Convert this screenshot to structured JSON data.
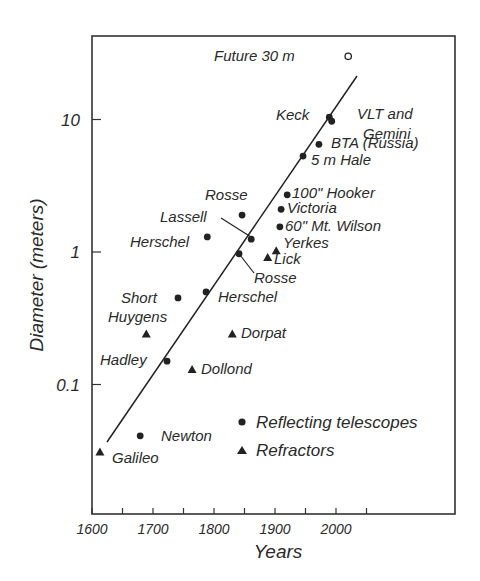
{
  "chart_data": {
    "type": "scatter",
    "title": "",
    "xlabel": "Years",
    "ylabel": "Diameter (meters)",
    "yscale": "log",
    "xlim": [
      1600,
      2190
    ],
    "ylim": [
      0.012,
      70
    ],
    "x_ticks": [
      1600,
      1650,
      1700,
      1750,
      1800,
      1850,
      1900,
      1950,
      2000,
      2050
    ],
    "x_tick_labels": [
      "1600",
      "1700",
      "1800",
      "1900",
      "2000"
    ],
    "y_tick_labels": [
      "10",
      "1",
      "0.1"
    ],
    "grid": false,
    "legend": {
      "position": "lower right",
      "entries": [
        {
          "label": "Reflecting telescopes",
          "marker": "circle"
        },
        {
          "label": "Refractors",
          "marker": "triangle"
        }
      ]
    },
    "series": [
      {
        "name": "Reflecting telescopes",
        "marker": "circle",
        "points": [
          {
            "label": "Newton",
            "year": 1679,
            "diameter": 0.041
          },
          {
            "label": "Hadley",
            "year": 1723,
            "diameter": 0.15
          },
          {
            "label": "Short",
            "year": 1741,
            "diameter": 0.45
          },
          {
            "label": "Herschel",
            "year": 1787,
            "diameter": 0.5
          },
          {
            "label": "Herschel",
            "year": 1789,
            "diameter": 1.3
          },
          {
            "label": "Rosse",
            "year": 1841,
            "diameter": 0.97
          },
          {
            "label": "Rosse",
            "year": 1846,
            "diameter": 1.9
          },
          {
            "label": "Lassell",
            "year": 1861,
            "diameter": 1.25
          },
          {
            "label": "60\" Mt. Wilson",
            "year": 1908,
            "diameter": 1.55
          },
          {
            "label": "Victoria",
            "year": 1910,
            "diameter": 2.1
          },
          {
            "label": "100\" Hooker",
            "year": 1920,
            "diameter": 2.7
          },
          {
            "label": "5 m Hale",
            "year": 1946,
            "diameter": 5.3
          },
          {
            "label": "BTA (Russia)",
            "year": 1972,
            "diameter": 6.5
          },
          {
            "label": "Keck",
            "year": 1989,
            "diameter": 10.4
          },
          {
            "label": "VLT and Gemini",
            "year": 1993,
            "diameter": 9.7
          }
        ]
      },
      {
        "name": "Refractors",
        "marker": "triangle",
        "points": [
          {
            "label": "Galileo",
            "year": 1613,
            "diameter": 0.031
          },
          {
            "label": "Huygens",
            "year": 1689,
            "diameter": 0.24
          },
          {
            "label": "Dollond",
            "year": 1764,
            "diameter": 0.13
          },
          {
            "label": "Dorpat",
            "year": 1830,
            "diameter": 0.24
          },
          {
            "label": "Lick",
            "year": 1888,
            "diameter": 0.91
          },
          {
            "label": "Yerkes",
            "year": 1902,
            "diameter": 1.02
          }
        ]
      },
      {
        "name": "Future",
        "marker": "open-circle",
        "points": [
          {
            "label": "Future 30 m",
            "year": 2020,
            "diameter": 30
          }
        ]
      }
    ],
    "trend_line": {
      "from": {
        "year": 1624,
        "diameter": 0.042
      },
      "to": {
        "year": 2035,
        "diameter": 20.5
      }
    }
  }
}
